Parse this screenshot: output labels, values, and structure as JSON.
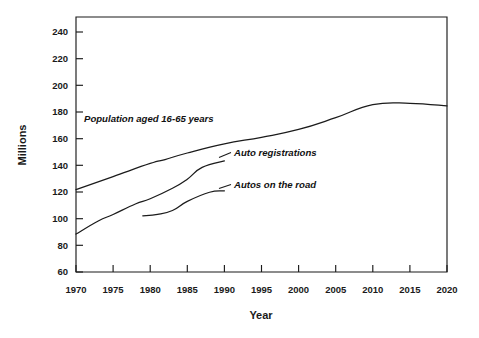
{
  "chart_data": {
    "type": "line",
    "title": "",
    "xlabel": "Year",
    "ylabel": "Millions",
    "xlim": [
      1970,
      2020
    ],
    "ylim": [
      60,
      255
    ],
    "grid": false,
    "legend_position": "inline-annotations",
    "x_ticks": [
      "1970",
      "1975",
      "1980",
      "1985",
      "1990",
      "1995",
      "2000",
      "2005",
      "2010",
      "2015",
      "2020"
    ],
    "y_ticks": [
      "60",
      "80",
      "100",
      "120",
      "140",
      "160",
      "180",
      "200",
      "220",
      "240"
    ],
    "series": [
      {
        "name": "Population aged 16-65 years",
        "label": "Population aged 16-65 years",
        "x": [
          1970,
          1975,
          1980,
          1982,
          1985,
          1990,
          1995,
          2000,
          2005,
          2010,
          2015,
          2020
        ],
        "values": [
          123,
          133,
          143,
          146,
          151,
          158,
          163,
          169,
          178,
          188,
          189,
          187
        ]
      },
      {
        "name": "Auto registrations",
        "label": "Auto registrations",
        "x": [
          1970,
          1973,
          1975,
          1978,
          1980,
          1983,
          1985,
          1987,
          1990
        ],
        "values": [
          89,
          99,
          104,
          112,
          116,
          124,
          131,
          140,
          145
        ]
      },
      {
        "name": "Autos on the road",
        "label": "Autos on the road",
        "x": [
          1979,
          1981,
          1983,
          1985,
          1988,
          1990
        ],
        "values": [
          103,
          104,
          107,
          114,
          121,
          122
        ]
      }
    ]
  },
  "annotations": {
    "population": {
      "label": "Population aged 16-65 years"
    },
    "registrations": {
      "label": "Auto registrations"
    },
    "on_road": {
      "label": "Autos on the road"
    }
  }
}
